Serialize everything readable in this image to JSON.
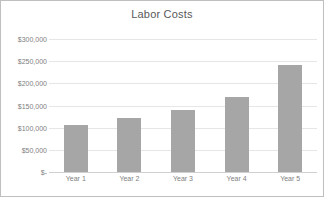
{
  "chart_data": {
    "type": "bar",
    "title": "Labor Costs",
    "xlabel": "",
    "ylabel": "",
    "categories": [
      "Year 1",
      "Year 2",
      "Year 3",
      "Year 4",
      "Year 5"
    ],
    "values": [
      105000,
      122000,
      140000,
      170000,
      242000
    ],
    "series": [
      {
        "name": "Labor Costs",
        "values": [
          105000,
          122000,
          140000,
          170000,
          242000
        ]
      }
    ],
    "ylim": [
      0,
      300000
    ],
    "y_ticks": [
      0,
      50000,
      100000,
      150000,
      200000,
      250000,
      300000
    ],
    "y_tick_labels": [
      "$-",
      "$50,000",
      "$100,000",
      "$150,000",
      "$200,000",
      "$250,000",
      "$300,000"
    ],
    "grid": true,
    "legend": false,
    "legend_position": "none",
    "bar_color": "#a6a6a6",
    "gridline_color": "#e6e6e6",
    "text_color": "#808080",
    "title_color": "#595959",
    "border_color": "#bfbfbf",
    "background_color": "#ffffff"
  }
}
